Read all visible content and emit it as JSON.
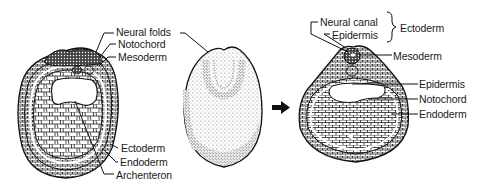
{
  "figure": {
    "colors": {
      "ink": "#1a1a1a",
      "background": "#ffffff",
      "stipple": "#555555"
    }
  },
  "panels": [
    {
      "id": "early-cross-section",
      "labels": [
        {
          "text": "Neural folds"
        },
        {
          "text": "Notochord"
        },
        {
          "text": "Mesoderm"
        },
        {
          "text": "Ectoderm"
        },
        {
          "text": "Endoderm"
        },
        {
          "text": "Archenteron"
        }
      ]
    },
    {
      "id": "external-view",
      "labels": []
    },
    {
      "id": "arrow",
      "icon": "right-arrow-icon"
    },
    {
      "id": "later-cross-section",
      "labels": [
        {
          "text": "Neural canal"
        },
        {
          "text": "Epidermis"
        },
        {
          "text": "Ectoderm"
        },
        {
          "text": "Mesoderm"
        },
        {
          "text": "Epidermis"
        },
        {
          "text": "Notochord"
        },
        {
          "text": "Endoderm"
        }
      ]
    }
  ]
}
